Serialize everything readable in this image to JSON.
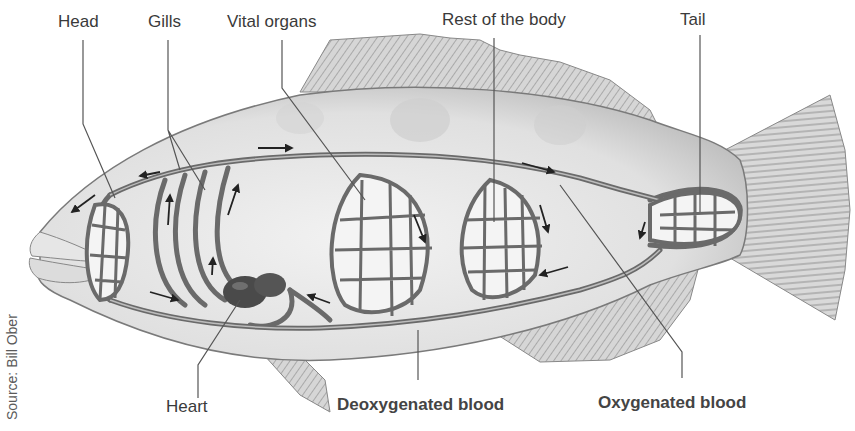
{
  "diagram": {
    "labels": {
      "head": "Head",
      "gills": "Gills",
      "vital_organs": "Vital organs",
      "rest_of_body": "Rest of the body",
      "tail": "Tail",
      "heart": "Heart",
      "deoxygenated_blood": "Deoxygenated blood",
      "oxygenated_blood": "Oxygenated blood"
    },
    "source": "Source: Bill Ober",
    "colors": {
      "background": "#ffffff",
      "body_fill": "#e4e4e4",
      "body_shadow": "#bdbdbd",
      "vessel": "#6a6a6a",
      "vessel_light": "#a9a9a9",
      "heart": "#4a4a4a",
      "fin": "#cfcfcf",
      "leader_line": "#555555",
      "label_text": "#3a3a3a"
    }
  }
}
